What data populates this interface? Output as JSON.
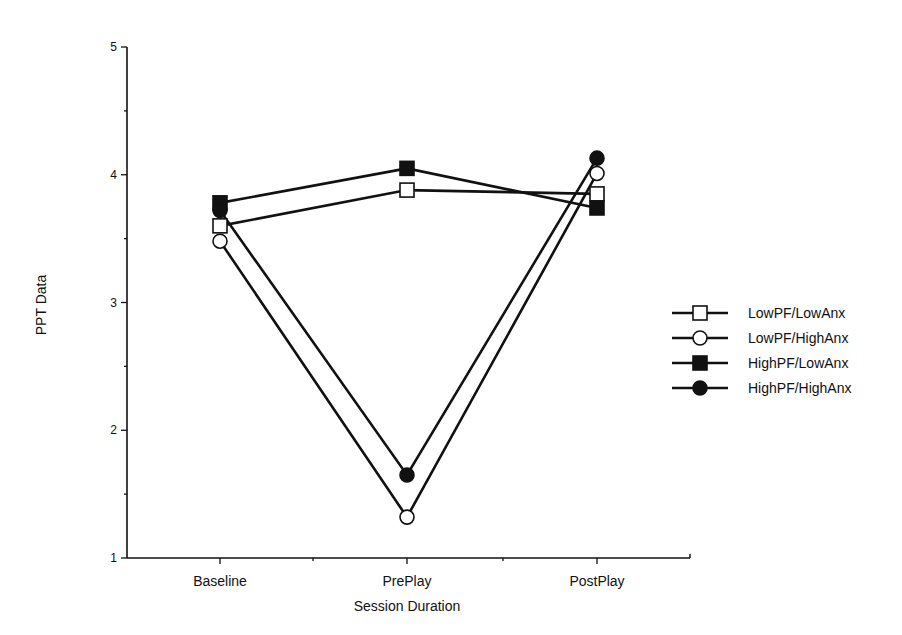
{
  "chart_data": {
    "type": "line",
    "title": "",
    "xlabel": "Session Duration",
    "ylabel": "PPT Data",
    "categories": [
      "Baseline",
      "PrePlay",
      "PostPlay"
    ],
    "ylim": [
      1,
      5
    ],
    "yticks": [
      1,
      2,
      3,
      4,
      5
    ],
    "y_minor_step": 0.5,
    "grid": false,
    "legend_position": "right",
    "series": [
      {
        "name": "LowPF/LowAnx",
        "marker": "square",
        "filled": false,
        "values": [
          3.6,
          3.88,
          3.85
        ]
      },
      {
        "name": "LowPF/HighAnx",
        "marker": "circle",
        "filled": false,
        "values": [
          3.48,
          1.32,
          4.01
        ]
      },
      {
        "name": "HighPF/LowAnx",
        "marker": "square",
        "filled": true,
        "values": [
          3.78,
          4.05,
          3.74
        ]
      },
      {
        "name": "HighPF/HighAnx",
        "marker": "circle",
        "filled": true,
        "values": [
          3.72,
          1.65,
          4.13
        ]
      }
    ],
    "colors": {
      "line": "#111111",
      "fill": "#111111",
      "open_fill": "#ffffff"
    }
  }
}
